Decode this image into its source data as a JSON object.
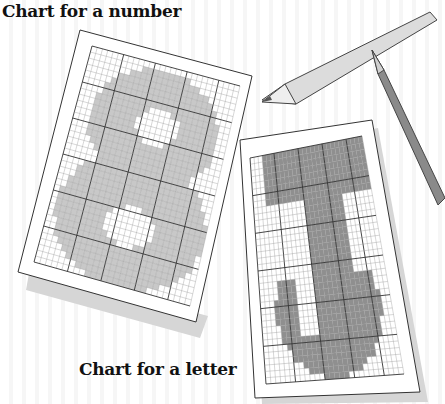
{
  "captions": {
    "number_chart": "Chart for a number",
    "letter_chart": "Chart for a letter"
  },
  "charts": [
    {
      "id": "number",
      "symbol": "8",
      "fill_color": "#c8c8c8",
      "grid_cols": 28,
      "grid_rows": 36
    },
    {
      "id": "letter",
      "symbol": "J",
      "fill_color": "#8f8f8f",
      "grid_cols": 28,
      "grid_rows": 36
    }
  ],
  "objects": [
    "pencil-light",
    "pencil-dark"
  ],
  "colors": {
    "paper": "#ffffff",
    "outline": "#333333",
    "shadow": "#d0d0d0"
  }
}
